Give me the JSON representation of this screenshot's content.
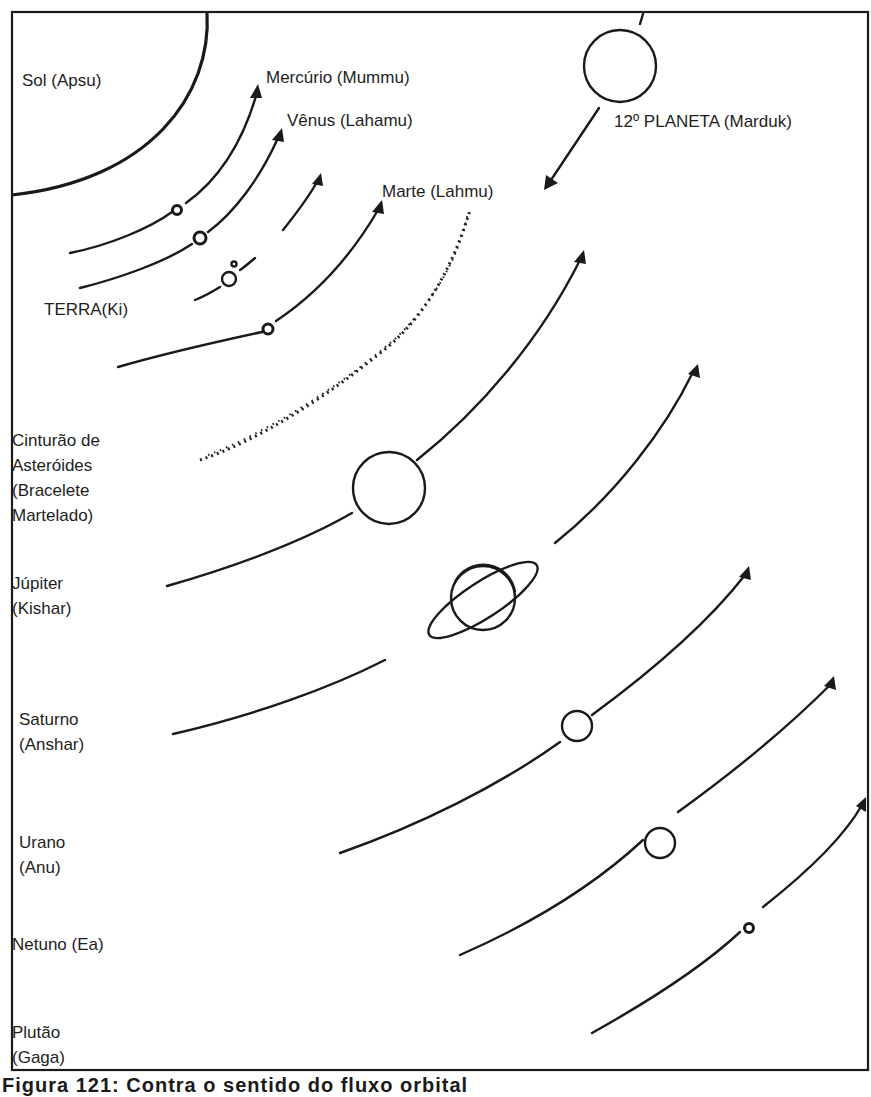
{
  "figure": {
    "caption": "Figura 121: Contra o sentido do fluxo orbital",
    "colors": {
      "ink": "#1a1a1a",
      "background": "#ffffff"
    }
  },
  "labels": {
    "sun": "Sol (Apsu)",
    "mercury": "Mercúrio (Mummu)",
    "venus": "Vênus (Lahamu)",
    "mars": "Marte (Lahmu)",
    "marduk": "12º PLANETA (Marduk)",
    "earth": "TERRA(Ki)",
    "asteroid_belt": [
      "Cinturão de",
      "Asteróides",
      "(Bracelete",
      "Martelado)"
    ],
    "jupiter": [
      "Júpiter",
      "(Kishar)"
    ],
    "saturn": [
      "Saturno",
      "(Anshar)"
    ],
    "uranus": [
      "Urano",
      "(Anu)"
    ],
    "neptune": "Netuno (Ea)",
    "pluto": [
      "Plutão",
      "(Gaga)"
    ]
  }
}
